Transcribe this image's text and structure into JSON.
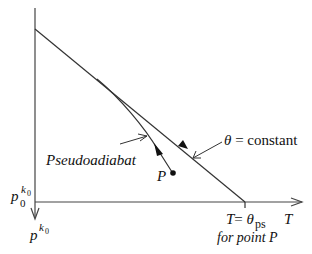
{
  "diagram": {
    "colors": {
      "line": "#333333",
      "text": "#111111",
      "background": "#ffffff"
    },
    "axes": {
      "y_axis": {
        "label_base": "p",
        "label_sup": "k",
        "label_sup_sub": "0"
      },
      "y_axis_origin": {
        "label_base": "p",
        "label_sub": "0",
        "label_sup": "k",
        "label_sup_sub": "0"
      },
      "x_axis": {
        "label": "T"
      }
    },
    "curves": {
      "theta_line": {
        "label_symbol": "θ",
        "label_eq": " = constant"
      },
      "pseudoadiabat": {
        "label": "Pseudoadiabat"
      }
    },
    "point": {
      "label": "P"
    },
    "intercept": {
      "label_T": "T",
      "label_eq": "= ",
      "label_theta": "θ",
      "label_sub": "ps",
      "note": "for point P"
    }
  }
}
